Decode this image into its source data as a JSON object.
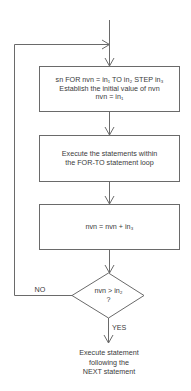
{
  "flowchart": {
    "title": "FOR-TO-STEP loop flowchart",
    "box_init": {
      "line1": "sn FOR nvn = in₁ TO in₂ STEP in₃",
      "line2": "Establish the initial value of nvn",
      "line3": "nvn = in₁"
    },
    "box_execute": {
      "line1": "Execute the statements within",
      "line2": "the FOR-TO statement loop"
    },
    "box_increment": {
      "line1": "nvn = nvn + in₃"
    },
    "decision": {
      "line1": "nvn > in₂",
      "line2": "?"
    },
    "branch_no": "NO",
    "branch_yes": "YES",
    "exit": {
      "line1": "Execute statement",
      "line2": "following the",
      "line3": "NEXT statement"
    },
    "colors": {
      "line": "#6a6a6a",
      "text": "#3a3a3a",
      "background": "#ffffff"
    }
  }
}
